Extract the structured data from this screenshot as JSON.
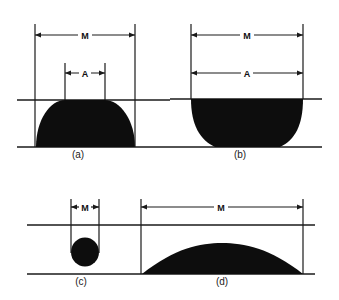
{
  "figure": {
    "panels": [
      {
        "id": "a",
        "caption": "(a)",
        "dimension_labels": {
          "outer": "M",
          "inner": "A"
        }
      },
      {
        "id": "b",
        "caption": "(b)",
        "dimension_labels": {
          "outer": "M",
          "inner": "A"
        }
      },
      {
        "id": "c",
        "caption": "(c)",
        "dimension_labels": {
          "outer": "M"
        }
      },
      {
        "id": "d",
        "caption": "(d)",
        "dimension_labels": {
          "outer": "M"
        }
      }
    ],
    "colors": {
      "ink": "#0d0d0d",
      "background": "#ffffff"
    }
  }
}
